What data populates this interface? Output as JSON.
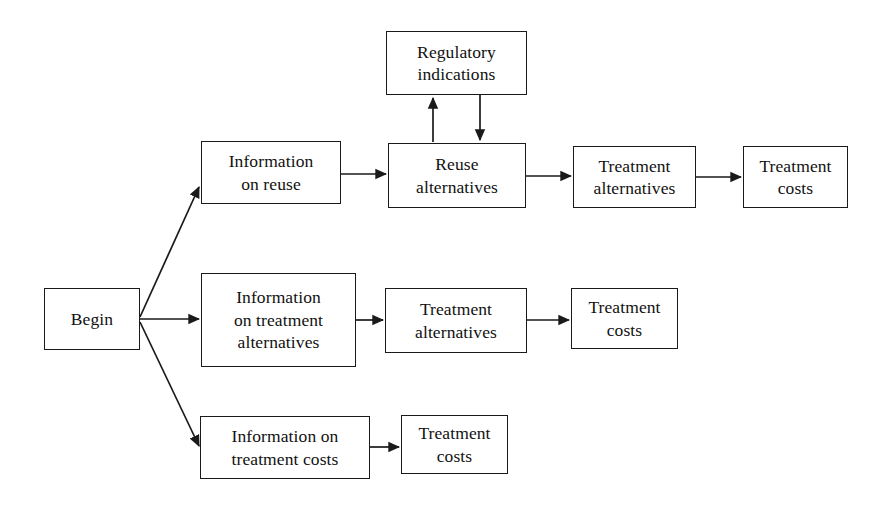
{
  "diagram": {
    "type": "flowchart",
    "title": "",
    "background_color": "#ffffff",
    "line_color": "#1a1a1a",
    "text_color": "#111111",
    "nodes": [
      {
        "id": "begin",
        "label": "Begin",
        "x": 44,
        "y": 288,
        "w": 96,
        "h": 62
      },
      {
        "id": "info_reuse",
        "label": "Information\non reuse",
        "x": 201,
        "y": 141,
        "w": 140,
        "h": 63
      },
      {
        "id": "regulatory_indications",
        "label": "Regulatory\nindications",
        "x": 386,
        "y": 31,
        "w": 141,
        "h": 64
      },
      {
        "id": "reuse_alternatives",
        "label": "Reuse\nalternatives",
        "x": 388,
        "y": 143,
        "w": 138,
        "h": 65
      },
      {
        "id": "treatment_alternatives_top",
        "label": "Treatment\nalternatives",
        "x": 573,
        "y": 146,
        "w": 123,
        "h": 62
      },
      {
        "id": "treatment_costs_top",
        "label": "Treatment\ncosts",
        "x": 743,
        "y": 146,
        "w": 105,
        "h": 62
      },
      {
        "id": "info_treatment_alternatives",
        "label": "Information\non treatment\nalternatives",
        "x": 201,
        "y": 273,
        "w": 155,
        "h": 94
      },
      {
        "id": "treatment_alternatives_mid",
        "label": "Treatment\nalternatives",
        "x": 385,
        "y": 288,
        "w": 142,
        "h": 65
      },
      {
        "id": "treatment_costs_mid",
        "label": "Treatment\ncosts",
        "x": 571,
        "y": 288,
        "w": 107,
        "h": 61
      },
      {
        "id": "info_treatment_costs",
        "label": "Information on\ntreatment costs",
        "x": 200,
        "y": 416,
        "w": 170,
        "h": 63
      },
      {
        "id": "treatment_costs_bottom",
        "label": "Treatment\ncosts",
        "x": 401,
        "y": 415,
        "w": 107,
        "h": 59
      }
    ],
    "edges": [
      {
        "id": "begin-to-info-reuse",
        "from": "begin",
        "to": "info_reuse",
        "kind": "diagonal-up",
        "points": "140,317 199,187"
      },
      {
        "id": "begin-to-info-treatment-alternatives",
        "from": "begin",
        "to": "info_treatment_alternatives",
        "kind": "horizontal",
        "points": "140,319 199,319"
      },
      {
        "id": "begin-to-info-treatment-costs",
        "from": "begin",
        "to": "info_treatment_costs",
        "kind": "diagonal-down",
        "points": "140,322 199,446"
      },
      {
        "id": "info-reuse-to-reuse-alternatives",
        "from": "info_reuse",
        "to": "reuse_alternatives",
        "kind": "horizontal",
        "points": "341,174 386,174"
      },
      {
        "id": "reuse-alternatives-to-regulatory",
        "from": "reuse_alternatives",
        "to": "regulatory_indications",
        "kind": "vertical-up",
        "points": "433,142 433,97"
      },
      {
        "id": "regulatory-to-reuse-alternatives",
        "from": "regulatory_indications",
        "to": "reuse_alternatives",
        "kind": "vertical-down",
        "points": "480,95 480,141"
      },
      {
        "id": "reuse-alternatives-to-treatment-alternatives",
        "from": "reuse_alternatives",
        "to": "treatment_alternatives_top",
        "kind": "horizontal",
        "points": "526,176 571,176"
      },
      {
        "id": "treatment-alternatives-to-treatment-costs-top",
        "from": "treatment_alternatives_top",
        "to": "treatment_costs_top",
        "kind": "horizontal",
        "points": "696,177 741,177"
      },
      {
        "id": "info-treatment-alternatives-to-treatment-alternatives",
        "from": "info_treatment_alternatives",
        "to": "treatment_alternatives_mid",
        "kind": "horizontal",
        "points": "356,320 383,320"
      },
      {
        "id": "treatment-alternatives-mid-to-treatment-costs-mid",
        "from": "treatment_alternatives_mid",
        "to": "treatment_costs_mid",
        "kind": "horizontal",
        "points": "527,320 569,320"
      },
      {
        "id": "info-treatment-costs-to-treatment-costs",
        "from": "info_treatment_costs",
        "to": "treatment_costs_bottom",
        "kind": "horizontal",
        "points": "370,447 399,447"
      }
    ]
  }
}
